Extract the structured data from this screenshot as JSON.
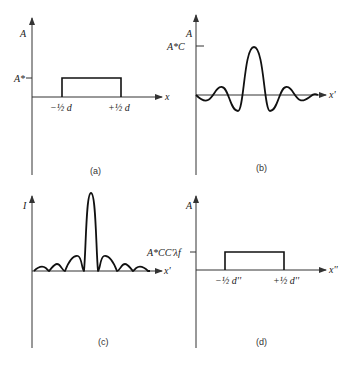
{
  "panels": [
    {
      "id": "a",
      "caption": "(a)",
      "y_label": "A",
      "x_label": "x",
      "level_label": "A*",
      "left_edge_label": "−½ d",
      "right_edge_label": "+½ d",
      "shape": "rectangular aperture"
    },
    {
      "id": "b",
      "caption": "(b)",
      "y_label": "A",
      "x_label": "x'",
      "level_label": "A*C",
      "shape": "sinc amplitude"
    },
    {
      "id": "c",
      "caption": "(c)",
      "y_label": "I",
      "x_label": "x'",
      "shape": "sinc squared intensity"
    },
    {
      "id": "d",
      "caption": "(d)",
      "y_label": "A",
      "x_label": "x''",
      "level_label": "A*CC'λf",
      "left_edge_label": "−½ d''",
      "right_edge_label": "+½ d''",
      "shape": "rectangular image"
    }
  ]
}
